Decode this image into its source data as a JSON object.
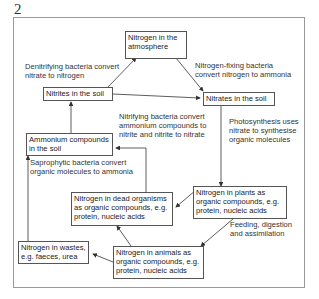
{
  "figure": {
    "number": "2"
  },
  "boxes": {
    "atmosphere": "Nitrogen in the atmosphere",
    "nitrites": "Nitrites in the soil",
    "nitrates": "Nitrates in the soil",
    "ammonium": "Ammonium compounds in the soil",
    "plants": "Nitrogen in plants as organic compounds, e.g. protein, nucleic acids",
    "dead": "Nitrogen in dead organisms as organic compounds, e.g. protein, nucleic acids",
    "wastes": "Nitrogen in wastes, e.g. faeces, urea",
    "animals": "Nitrogen in animals as organic compounds, e.g. protein, nucleic acids"
  },
  "labels": {
    "denitrifying": "Denitrifying bacteria convert nitrate to nitrogen",
    "nitrogen_fixing": "Nitrogen-fixing bacteria convert nitrogen to ammonia",
    "nitrifying": "Nitrifying bacteria convert ammonium compounds to nitrite and nitrite to nitrate",
    "photosynthesis": "Photosynthesis uses nitrate to synthesise organic molecules",
    "saprophytic": "Saprophytic bacteria convert organic molecules to ammonia",
    "feeding": "Feeding, digestion and assimilation"
  },
  "colors": {
    "line": "#333333",
    "frame": "#9a9a9a"
  }
}
